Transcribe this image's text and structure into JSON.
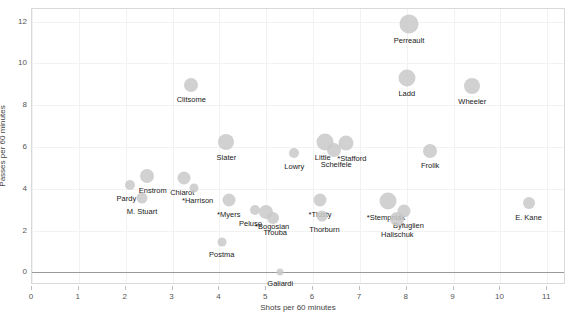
{
  "chart_data": {
    "type": "scatter",
    "title": "",
    "xlabel": "Shots per 60 minutes",
    "ylabel": "Passes per 60 minutes",
    "xlim": [
      0,
      11.4
    ],
    "ylim": [
      -0.6,
      12.6
    ],
    "xticks": [
      0,
      1,
      2,
      3,
      4,
      5,
      6,
      7,
      8,
      9,
      10,
      11
    ],
    "yticks": [
      0,
      2,
      4,
      6,
      8,
      10,
      12
    ],
    "grid": true,
    "zero_reference_line": 0,
    "marker_color": "#c9c9c9",
    "points": [
      {
        "label": "Perreault",
        "x": 8.05,
        "y": 11.9,
        "size": 19,
        "label_dx": 0,
        "label_dy": 12
      },
      {
        "label": "Clitsome",
        "x": 3.4,
        "y": 8.95,
        "size": 14,
        "label_dx": 0,
        "label_dy": 10
      },
      {
        "label": "Ladd",
        "x": 8.0,
        "y": 9.3,
        "size": 17,
        "label_dx": 0,
        "label_dy": 11
      },
      {
        "label": "Wheeler",
        "x": 9.4,
        "y": 8.9,
        "size": 16,
        "label_dx": 0,
        "label_dy": 11
      },
      {
        "label": "Slater",
        "x": 4.15,
        "y": 6.25,
        "size": 16,
        "label_dx": 0,
        "label_dy": 11
      },
      {
        "label": "Little",
        "x": 6.25,
        "y": 6.25,
        "size": 17,
        "label_dx": -2,
        "label_dy": 11
      },
      {
        "label": "Scheifele",
        "x": 6.45,
        "y": 5.85,
        "size": 14,
        "label_dx": 2,
        "label_dy": 10
      },
      {
        "label": "*Stafford",
        "x": 6.7,
        "y": 6.2,
        "size": 15,
        "label_dx": 6,
        "label_dy": 11
      },
      {
        "label": "Lowry",
        "x": 5.6,
        "y": 5.7,
        "size": 10,
        "label_dx": 0,
        "label_dy": 9
      },
      {
        "label": "Frolik",
        "x": 8.5,
        "y": 5.8,
        "size": 14,
        "label_dx": 0,
        "label_dy": 10
      },
      {
        "label": "Enstrom",
        "x": 2.45,
        "y": 4.6,
        "size": 14,
        "label_dx": 6,
        "label_dy": 10
      },
      {
        "label": "Pardy",
        "x": 2.1,
        "y": 4.2,
        "size": 10,
        "label_dx": -4,
        "label_dy": 9
      },
      {
        "label": "M. Stuart",
        "x": 2.35,
        "y": 3.55,
        "size": 11,
        "label_dx": 0,
        "label_dy": 9
      },
      {
        "label": "Chiarot",
        "x": 3.25,
        "y": 4.5,
        "size": 13,
        "label_dx": -2,
        "label_dy": 10
      },
      {
        "label": "*Harrison",
        "x": 3.45,
        "y": 4.05,
        "size": 9,
        "label_dx": 4,
        "label_dy": 8
      },
      {
        "label": "*Myers",
        "x": 4.2,
        "y": 3.45,
        "size": 13,
        "label_dx": 0,
        "label_dy": 10
      },
      {
        "label": "Peluso",
        "x": 4.75,
        "y": 3.0,
        "size": 10,
        "label_dx": -4,
        "label_dy": 9
      },
      {
        "label": "*Bogosian",
        "x": 5.0,
        "y": 2.9,
        "size": 14,
        "label_dx": 6,
        "label_dy": 10
      },
      {
        "label": "Trouba",
        "x": 5.15,
        "y": 2.6,
        "size": 12,
        "label_dx": 2,
        "label_dy": 10
      },
      {
        "label": "*Tlusty",
        "x": 6.15,
        "y": 3.45,
        "size": 13,
        "label_dx": 0,
        "label_dy": 10
      },
      {
        "label": "Thorburn",
        "x": 6.2,
        "y": 2.7,
        "size": 11,
        "label_dx": 2,
        "label_dy": 9
      },
      {
        "label": "*Stempniak",
        "x": 7.6,
        "y": 3.4,
        "size": 17,
        "label_dx": -2,
        "label_dy": 12
      },
      {
        "label": "Byfuglien",
        "x": 7.95,
        "y": 2.95,
        "size": 13,
        "label_dx": 4,
        "label_dy": 10
      },
      {
        "label": "Halischuk",
        "x": 7.8,
        "y": 2.55,
        "size": 14,
        "label_dx": 0,
        "label_dy": 11
      },
      {
        "label": "E. Kane",
        "x": 10.6,
        "y": 3.3,
        "size": 12,
        "label_dx": 0,
        "label_dy": 10
      },
      {
        "label": "Postma",
        "x": 4.05,
        "y": 1.45,
        "size": 9,
        "label_dx": 0,
        "label_dy": 8
      },
      {
        "label": "Galiardi",
        "x": 5.3,
        "y": 0.0,
        "size": 7,
        "label_dx": 0,
        "label_dy": 7
      }
    ]
  }
}
